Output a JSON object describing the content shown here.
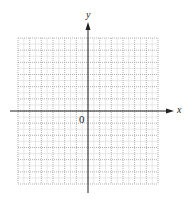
{
  "diagram": {
    "type": "coordinate-plane",
    "grid": {
      "columns": 12,
      "rows": 12,
      "left": 18,
      "top": 38,
      "right": 158,
      "bottom": 184,
      "minor_subdivisions": 2,
      "major_color": "#a8a8a8",
      "minor_color": "#e2e2e2"
    },
    "axes": {
      "origin_x": 88,
      "origin_y": 111,
      "x_start": 10,
      "x_end": 174,
      "y_start": 193,
      "y_end": 22,
      "color": "#222222"
    },
    "labels": {
      "x_axis": "x",
      "y_axis": "y",
      "origin": "0"
    }
  }
}
